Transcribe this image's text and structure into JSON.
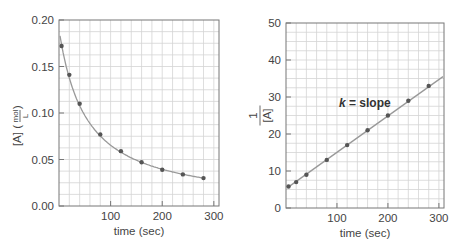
{
  "chart_data": [
    {
      "type": "scatter",
      "title": "",
      "xlabel": "time (sec)",
      "ylabel": "[A] (mol/L)",
      "ylabel_parts": {
        "main": "[A] (",
        "num": "mol",
        "den": "L",
        "close": ")"
      },
      "xlim": [
        0,
        310
      ],
      "ylim": [
        0,
        0.2
      ],
      "xticks": [
        100,
        200,
        300
      ],
      "xtick_labels": [
        "100",
        "200",
        "300"
      ],
      "yticks": [
        0.0,
        0.05,
        0.1,
        0.15,
        0.2
      ],
      "ytick_labels": [
        "0.00",
        "0.05",
        "0.10",
        "0.15",
        "0.20"
      ],
      "grid": true,
      "series": [
        {
          "name": "[A] vs time",
          "x": [
            5,
            20,
            40,
            80,
            120,
            160,
            200,
            240,
            280
          ],
          "y": [
            0.172,
            0.141,
            0.11,
            0.077,
            0.059,
            0.047,
            0.039,
            0.034,
            0.03
          ],
          "fit": "curve"
        }
      ],
      "legend": null
    },
    {
      "type": "scatter",
      "title": "",
      "xlabel": "time (sec)",
      "ylabel": "1/[A]",
      "ylabel_parts": {
        "num": "1",
        "den": "[A]"
      },
      "xlim": [
        0,
        310
      ],
      "ylim": [
        0,
        50
      ],
      "xticks": [
        100,
        200,
        300
      ],
      "xtick_labels": [
        "100",
        "200",
        "300"
      ],
      "yticks": [
        0,
        10,
        20,
        30,
        40,
        50
      ],
      "ytick_labels": [
        "0",
        "10",
        "20",
        "30",
        "40",
        "50"
      ],
      "grid": true,
      "series": [
        {
          "name": "1/[A] vs time",
          "x": [
            5,
            20,
            40,
            80,
            120,
            160,
            200,
            240,
            280
          ],
          "y": [
            5.8,
            7.0,
            9.0,
            13.0,
            17.0,
            21.0,
            25.0,
            29.0,
            33.0
          ],
          "fit": "linear"
        }
      ],
      "annotations": [
        {
          "text_italic": "k",
          "text": " = slope",
          "x": 105,
          "y": 28
        }
      ],
      "legend": null
    }
  ]
}
